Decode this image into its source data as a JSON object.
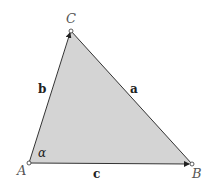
{
  "diagram": {
    "type": "triangle",
    "fill_color": "#d4d4d4",
    "stroke_color": "#333333",
    "vertices": {
      "A": {
        "label": "A",
        "x": 29,
        "y": 163
      },
      "B": {
        "label": "B",
        "x": 192,
        "y": 164
      },
      "C": {
        "label": "C",
        "x": 71,
        "y": 31
      }
    },
    "sides": {
      "a": {
        "label": "a",
        "from": "B",
        "to": "C"
      },
      "b": {
        "label": "b",
        "from": "A",
        "to": "C"
      },
      "c": {
        "label": "c",
        "from": "A",
        "to": "B"
      }
    },
    "angles": {
      "alpha": {
        "label": "α",
        "at": "A"
      }
    }
  }
}
